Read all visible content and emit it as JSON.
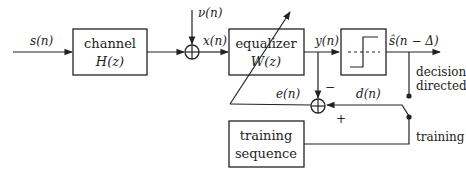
{
  "diagram": {
    "type": "block-diagram",
    "colors": {
      "stroke": "#222222",
      "background": "#ffffff"
    },
    "signals": {
      "input": "s(n)",
      "noise": "ν(n)",
      "equalizer_input": "x(n)",
      "equalizer_output": "y(n)",
      "decision_output": "ŝ(n − Δ)",
      "error": "e(n)",
      "desired": "d(n)"
    },
    "blocks": {
      "channel": {
        "line1": "channel",
        "line2": "H(z)"
      },
      "equalizer": {
        "line1": "equalizer",
        "line2": "W(z)"
      },
      "decision": {
        "symbol": "step-quantizer"
      },
      "training": {
        "line1": "training",
        "line2": "sequence"
      }
    },
    "summers": {
      "noise_sum": {
        "inputs": [
          "+",
          "+"
        ]
      },
      "error_sum": {
        "minus_sign": "−",
        "plus_sign": "+"
      }
    },
    "switch": {
      "position_decision": "decision\ndirected",
      "position_decision_line1": "decision",
      "position_decision_line2": "directed",
      "position_training": "training"
    }
  }
}
